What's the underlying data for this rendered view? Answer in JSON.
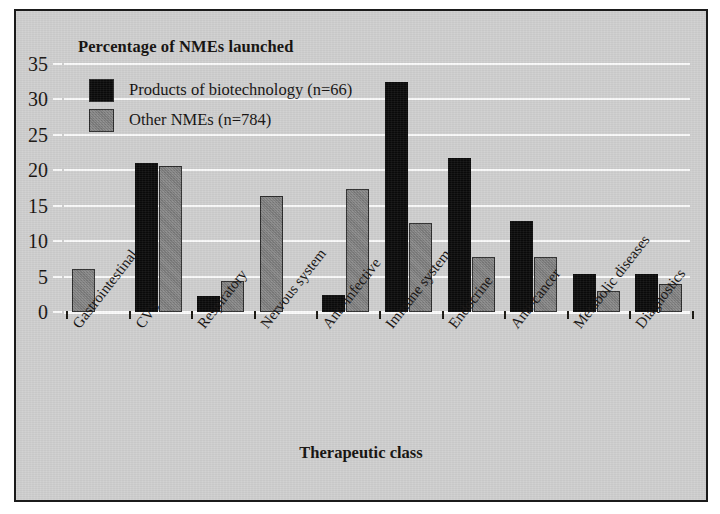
{
  "chart_data": {
    "type": "bar",
    "title": "Percentage of NMEs launched",
    "xlabel": "Therapeutic class",
    "ylabel": "Percentage of NMEs launched",
    "ylim": [
      0,
      35
    ],
    "yticks": [
      0,
      5,
      10,
      15,
      20,
      25,
      30,
      35
    ],
    "grid": true,
    "legend_position": "top-left",
    "categories": [
      "Gastrointestinal",
      "CVS",
      "Respiratory",
      "Nervous system",
      "Anti-infective",
      "Immune system",
      "Endocrine",
      "Anti-cancer",
      "Metabolic diseases",
      "Diagnostics"
    ],
    "series": [
      {
        "name": "Products of biotechnology (n=66)",
        "color": "#0a0a0a",
        "values": [
          0.0,
          21.0,
          2.3,
          0.0,
          2.4,
          32.5,
          21.7,
          12.8,
          5.3,
          5.4
        ]
      },
      {
        "name": "Other NMEs (n=784)",
        "color": "#7e7e7e",
        "values": [
          6.1,
          20.6,
          4.4,
          16.4,
          17.3,
          12.5,
          7.8,
          7.8,
          2.9,
          4.0
        ]
      }
    ]
  },
  "colors": {
    "background": "#cfcfcf",
    "frame": "#1b1b1b",
    "gridline": "#fbfbfb",
    "series_biotech": "#0a0a0a",
    "series_other": "#7e7e7e",
    "text": "#141110"
  }
}
